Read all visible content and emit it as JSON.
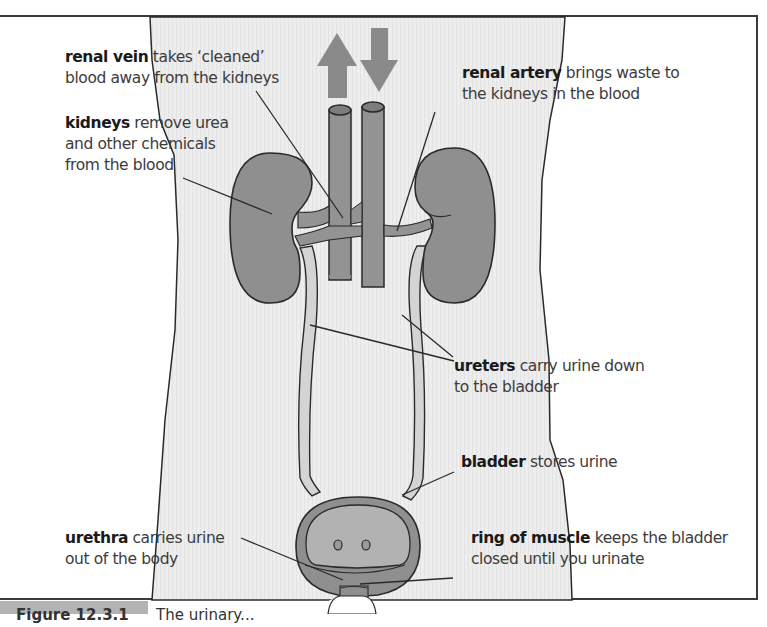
{
  "figure": {
    "colors": {
      "body_fill": "#ececec",
      "organ_fill": "#8f8f8f",
      "organ_dark": "#7a7a7a",
      "ureter_fill": "#d4d4d4",
      "vessel_fill": "#939393",
      "arrow_fill": "#8a8a8a",
      "outline": "#2a2a2a",
      "caption_tab": "#b3b3b3"
    },
    "arrows": [
      {
        "direction": "up",
        "meaning": "blood leaving"
      },
      {
        "direction": "down",
        "meaning": "blood entering"
      }
    ],
    "labels": {
      "renal_vein": {
        "term": "renal vein",
        "line1_rest": " takes ‘cleaned’",
        "line2": "blood away from the kidneys"
      },
      "kidneys": {
        "term": "kidneys",
        "line1_rest": " remove urea",
        "line2": "and other chemicals",
        "line3": "from the blood"
      },
      "renal_artery": {
        "term": "renal artery",
        "line1_rest": " brings waste to",
        "line2": "the kidneys in the blood"
      },
      "ureters": {
        "term": "ureters",
        "line1_rest": " carry urine down",
        "line2": "to the bladder"
      },
      "bladder": {
        "term": "bladder",
        "line1_rest": " stores urine"
      },
      "urethra": {
        "term": "urethra",
        "line1_rest": " carries urine",
        "line2": "out of the body"
      },
      "ring_of_muscle": {
        "term": "ring of muscle",
        "line1_rest": " keeps the bladder",
        "line2": "closed until you urinate"
      }
    },
    "caption": {
      "number": "Figure 12.3.1",
      "text": "The urinary..."
    }
  }
}
